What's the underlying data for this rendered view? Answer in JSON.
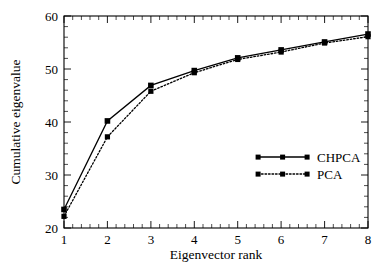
{
  "chart_data": {
    "type": "line",
    "title": "",
    "xlabel": "Eigenvector rank",
    "ylabel": "Cumulative eigenvalue",
    "x": [
      1,
      2,
      3,
      4,
      5,
      6,
      7,
      8
    ],
    "xlim": [
      1,
      8
    ],
    "ylim": [
      20,
      60
    ],
    "xticks": [
      "1",
      "2",
      "3",
      "4",
      "5",
      "6",
      "7",
      "8"
    ],
    "yticks": [
      "20",
      "30",
      "40",
      "50",
      "60"
    ],
    "xtick_values": [
      1,
      2,
      3,
      4,
      5,
      6,
      7,
      8
    ],
    "ytick_values": [
      20,
      30,
      40,
      50,
      60
    ],
    "grid": false,
    "legend_position": "lower-right",
    "series": [
      {
        "name": "CHPCA",
        "style": "solid",
        "marker": "square",
        "color": "#000000",
        "values": [
          23.5,
          40.2,
          46.9,
          49.7,
          52.1,
          53.6,
          55.1,
          56.6
        ]
      },
      {
        "name": "PCA",
        "style": "dotted",
        "marker": "square",
        "color": "#000000",
        "values": [
          22.2,
          37.2,
          45.8,
          49.3,
          51.8,
          53.2,
          54.9,
          56.1
        ]
      }
    ]
  },
  "axes": {
    "x_title": "Eigenvector rank",
    "y_title": "Cumulative eigenvalue"
  },
  "legend": {
    "entries": [
      {
        "label": "CHPCA"
      },
      {
        "label": "PCA"
      }
    ]
  }
}
